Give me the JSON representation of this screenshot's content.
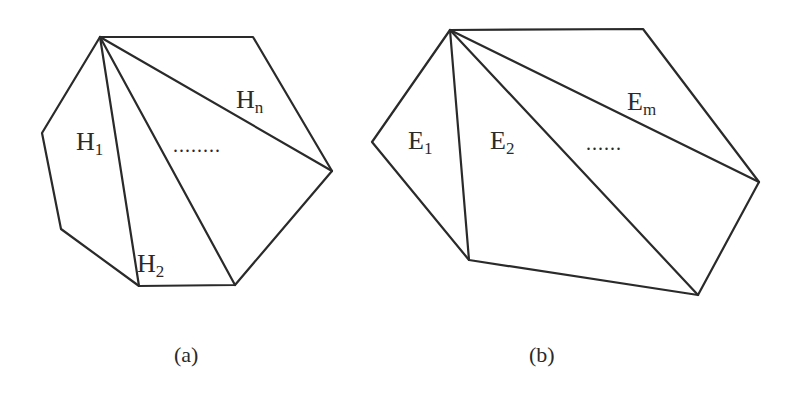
{
  "figure_a": {
    "caption": "(a)",
    "labels": [
      {
        "base": "H",
        "sub": "1",
        "x": 76,
        "y": 150
      },
      {
        "base": "H",
        "sub": "2",
        "x": 137,
        "y": 272
      },
      {
        "base": "H",
        "sub": "n",
        "x": 236,
        "y": 108
      }
    ],
    "ellipsis": "........",
    "ellipsis_pos": {
      "x": 173,
      "y": 152
    },
    "polygon": [
      [
        100,
        37
      ],
      [
        253,
        37
      ],
      [
        332,
        171
      ],
      [
        235,
        285
      ],
      [
        139,
        286
      ],
      [
        42,
        133
      ],
      [
        61,
        229
      ]
    ],
    "fan_apex": [
      100,
      37
    ],
    "diagonals": [
      [
        139,
        286
      ],
      [
        235,
        285
      ],
      [
        332,
        171
      ]
    ]
  },
  "figure_b": {
    "caption": "(b)",
    "labels": [
      {
        "base": "E",
        "sub": "1",
        "x": 408,
        "y": 149
      },
      {
        "base": "E",
        "sub": "2",
        "x": 490,
        "y": 149
      },
      {
        "base": "E",
        "sub": "m",
        "x": 627,
        "y": 110
      }
    ],
    "ellipsis": "......",
    "ellipsis_pos": {
      "x": 586,
      "y": 152
    },
    "polygon": [
      [
        450,
        30
      ],
      [
        643,
        29
      ],
      [
        759,
        182
      ],
      [
        698,
        295
      ],
      [
        469,
        260
      ],
      [
        372,
        142
      ]
    ],
    "fan_apex": [
      450,
      30
    ],
    "diagonals": [
      [
        469,
        260
      ],
      [
        698,
        295
      ],
      [
        759,
        182
      ]
    ]
  },
  "captions": {
    "a": "(a)",
    "b": "(b)"
  }
}
